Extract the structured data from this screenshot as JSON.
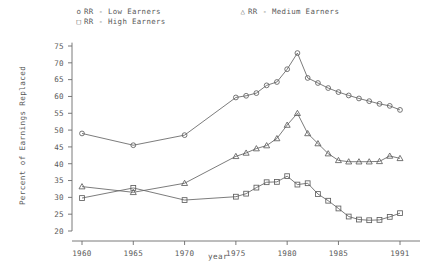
{
  "chart_data": {
    "type": "line",
    "title": "",
    "xlabel": "year",
    "ylabel": "Percent of Earnings Replaced",
    "xlim": [
      1959,
      1992
    ],
    "ylim": [
      20,
      76
    ],
    "xticks": [
      1960,
      1965,
      1970,
      1975,
      1980,
      1985,
      1991
    ],
    "xtick_labels": [
      "1960",
      "1965",
      "1970",
      "1975",
      "1980",
      "1985",
      "1991"
    ],
    "yticks": [
      20,
      25,
      30,
      35,
      40,
      45,
      50,
      55,
      60,
      65,
      70,
      75
    ],
    "ytick_labels": [
      "20",
      "25",
      "30",
      "35",
      "40",
      "45",
      "50",
      "55",
      "60",
      "65",
      "70",
      "75"
    ],
    "grid": false,
    "legend_position": "above-plot",
    "marker_color": "#5f5f5f",
    "line_color": "#646464",
    "series": [
      {
        "name": "RR - Low Earners",
        "marker": "circle",
        "legend_glyph": "o",
        "x": [
          1960,
          1965,
          1970,
          1975,
          1976,
          1977,
          1978,
          1979,
          1980,
          1981,
          1982,
          1983,
          1984,
          1985,
          1986,
          1987,
          1988,
          1989,
          1990,
          1991
        ],
        "values": [
          49.0,
          45.5,
          48.5,
          59.7,
          60.2,
          61.0,
          63.3,
          64.3,
          68.1,
          72.9,
          65.5,
          64.0,
          62.5,
          61.3,
          60.3,
          59.4,
          58.6,
          57.8,
          57.2,
          56.0
        ]
      },
      {
        "name": "RR - Medium Earners",
        "marker": "triangle",
        "legend_glyph": "△",
        "x": [
          1960,
          1965,
          1970,
          1975,
          1976,
          1977,
          1978,
          1979,
          1980,
          1981,
          1982,
          1983,
          1984,
          1985,
          1986,
          1987,
          1988,
          1989,
          1990,
          1991
        ],
        "values": [
          33.2,
          31.5,
          34.2,
          42.2,
          43.2,
          44.5,
          45.4,
          47.5,
          51.5,
          55.0,
          49.0,
          46.0,
          43.0,
          41.0,
          40.6,
          40.6,
          40.6,
          40.7,
          42.3,
          41.6
        ]
      },
      {
        "name": "RR - High Earners",
        "marker": "square",
        "legend_glyph": "□",
        "x": [
          1960,
          1965,
          1970,
          1975,
          1976,
          1977,
          1978,
          1979,
          1980,
          1981,
          1982,
          1983,
          1984,
          1985,
          1986,
          1987,
          1988,
          1989,
          1990,
          1991
        ],
        "values": [
          29.8,
          32.8,
          29.2,
          30.2,
          31.1,
          32.9,
          34.5,
          34.6,
          36.3,
          33.8,
          34.2,
          31.0,
          29.0,
          26.7,
          24.3,
          23.4,
          23.2,
          23.3,
          24.2,
          25.3
        ]
      }
    ]
  },
  "legend": {
    "entries": [
      {
        "glyph": "o",
        "label": "RR - Low Earners"
      },
      {
        "glyph": "□",
        "label": "RR - High Earners"
      },
      {
        "glyph": "△",
        "label": "RR - Medium Earners"
      }
    ]
  },
  "axes": {
    "y_title": "Percent of Earnings Replaced",
    "x_title": "year"
  }
}
